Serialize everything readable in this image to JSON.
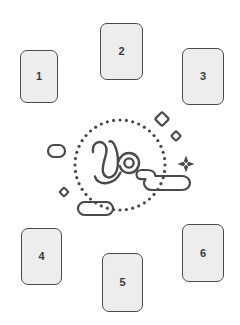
{
  "page": {
    "background_color": "#ffffff",
    "width": 240,
    "height": 325
  },
  "theme": {
    "card_fill": "#ededed",
    "card_stroke": "#4a4a4a",
    "label_color": "#3a3a3a",
    "line_color": "#4a4a4a",
    "dot_color": "#4a4a4a"
  },
  "cards": [
    {
      "label": "1",
      "name": "card-1",
      "x": 20,
      "y": 50,
      "w": 38,
      "h": 53
    },
    {
      "label": "2",
      "name": "card-2",
      "x": 100,
      "y": 23,
      "w": 43,
      "h": 57
    },
    {
      "label": "3",
      "name": "card-3",
      "x": 182,
      "y": 48,
      "w": 42,
      "h": 57
    },
    {
      "label": "4",
      "name": "card-4",
      "x": 21,
      "y": 228,
      "w": 41,
      "h": 57
    },
    {
      "label": "5",
      "name": "card-5",
      "x": 102,
      "y": 253,
      "w": 41,
      "h": 59
    },
    {
      "label": "6",
      "name": "card-6",
      "x": 182,
      "y": 224,
      "w": 42,
      "h": 58
    }
  ],
  "illustration": {
    "name": "capricorn-zodiac-illustration",
    "symbol": "capricorn-glyph",
    "dotted_circle": {
      "center_x": 120,
      "center_y": 165,
      "radius": 45,
      "dot_count": 44,
      "dot_radius": 1.6
    },
    "decorations": [
      {
        "name": "diamond-large",
        "x": 162,
        "y": 119,
        "size": 7
      },
      {
        "name": "diamond-small",
        "x": 176,
        "y": 136,
        "size": 5
      },
      {
        "name": "diamond-tiny",
        "x": 64,
        "y": 192,
        "size": 4.5
      },
      {
        "name": "sparkle-four-point",
        "x": 186,
        "y": 164,
        "size": 9
      },
      {
        "name": "pill-left",
        "x": 48,
        "y": 145,
        "w": 17,
        "h": 12
      },
      {
        "name": "pill-bottom",
        "x": 78,
        "y": 202,
        "w": 35,
        "h": 13
      },
      {
        "name": "cloud-right",
        "x": 140,
        "y": 170,
        "w": 50,
        "h": 22
      }
    ]
  }
}
